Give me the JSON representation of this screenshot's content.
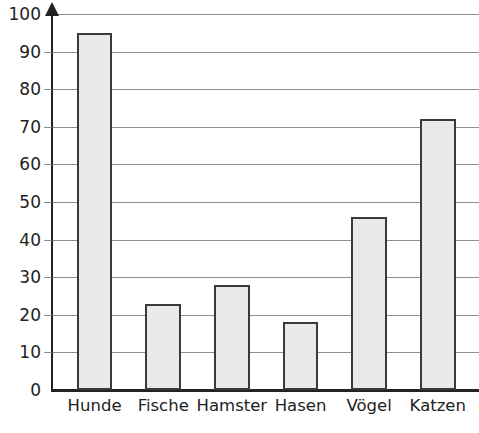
{
  "chart_data": {
    "type": "bar",
    "title": "",
    "subtitle": "",
    "xlabel": "",
    "ylabel": "",
    "categories": [
      "Hunde",
      "Fische",
      "Hamster",
      "Hasen",
      "Vögel",
      "Katzen"
    ],
    "values": [
      95,
      23,
      28,
      18,
      46,
      72
    ],
    "series": [
      {
        "name": "Anzahl",
        "values": [
          95,
          23,
          28,
          18,
          46,
          72
        ]
      }
    ],
    "ylim": [
      0,
      100
    ],
    "xlim": [
      0,
      6
    ],
    "ytick_labels": [
      "0",
      "10",
      "20",
      "30",
      "40",
      "50",
      "60",
      "70",
      "80",
      "90",
      "100"
    ],
    "ytick_values": [
      0,
      10,
      20,
      30,
      40,
      50,
      60,
      70,
      80,
      90,
      100
    ],
    "ytick_step": 10,
    "grid": true,
    "grid_axis": "y",
    "legend": false,
    "legend_position": "none",
    "annotations": [],
    "colors": {
      "bar_fill": "#e9e9e9",
      "bar_stroke": "#3a3a3a",
      "gridline": "#8e8e8e",
      "axis": "#222222",
      "text": "#222222",
      "background": "#ffffff"
    },
    "axis_arrow": {
      "y_axis_arrow": true,
      "x_axis_arrow": false
    }
  }
}
